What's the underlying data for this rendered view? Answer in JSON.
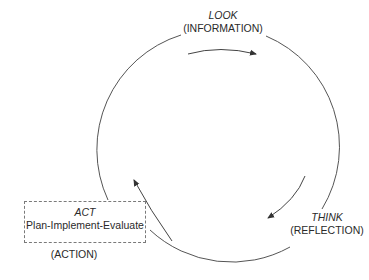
{
  "diagram": {
    "stages": [
      {
        "id": "look",
        "title": "LOOK",
        "subtitle": "(INFORMATION)"
      },
      {
        "id": "think",
        "title": "THINK",
        "subtitle": "(REFLECTION)"
      },
      {
        "id": "act",
        "title": "ACT",
        "subtitle": "Plan-Implement-Evaluate",
        "caption": "(ACTION)"
      }
    ],
    "flow": [
      "LOOK",
      "THINK",
      "ACT",
      "LOOK"
    ],
    "colors": {
      "line": "#555555",
      "box_border": "#7a7a7a",
      "text": "#2a2a2a"
    }
  }
}
